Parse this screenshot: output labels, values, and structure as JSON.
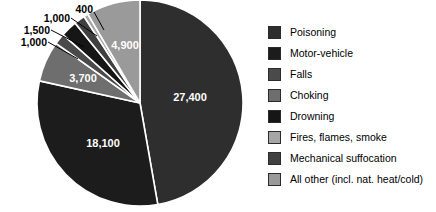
{
  "chart_data": {
    "type": "pie",
    "title": "",
    "subtitle": "",
    "xlabel": "",
    "ylabel": "",
    "legend_position": "right",
    "grid": false,
    "total": 58000,
    "categories": [
      "Poisoning",
      "Motor-vehicle",
      "Falls",
      "Choking",
      "Drowning",
      "Fires, flames, smoke",
      "Mechanical suffocation",
      "All other (incl. nat. heat/cold)"
    ],
    "values": [
      27400,
      18100,
      1000,
      3700,
      1500,
      400,
      1000,
      4900
    ],
    "value_labels": [
      "27,400",
      "18,100",
      "1,000",
      "3,700",
      "1,500",
      "400",
      "1,000",
      "4,900"
    ],
    "colors": [
      "#2e2e2e",
      "#1c1c1c",
      "#4a4a4a",
      "#6e6e6e",
      "#161616",
      "#a6a6a6",
      "#404040",
      "#9a9a9a"
    ],
    "slices": [
      {
        "name": "Poisoning",
        "value": 27400,
        "label": "27,400",
        "color": "#2e2e2e",
        "label_placement": "inside"
      },
      {
        "name": "Motor-vehicle",
        "value": 18100,
        "label": "18,100",
        "color": "#1c1c1c",
        "label_placement": "inside"
      },
      {
        "name": "Choking",
        "value": 3700,
        "label": "3,700",
        "color": "#6e6e6e",
        "label_placement": "inside"
      },
      {
        "name": "Falls",
        "value": 1000,
        "label": "1,000",
        "color": "#4a4a4a",
        "label_placement": "callout"
      },
      {
        "name": "Drowning",
        "value": 1500,
        "label": "1,500",
        "color": "#161616",
        "label_placement": "callout"
      },
      {
        "name": "Mechanical suffocation",
        "value": 1000,
        "label": "1,000",
        "color": "#404040",
        "label_placement": "callout"
      },
      {
        "name": "Fires, flames, smoke",
        "value": 400,
        "label": "400",
        "color": "#a6a6a6",
        "label_placement": "callout"
      },
      {
        "name": "All other (incl. nat. heat/cold)",
        "value": 4900,
        "label": "4,900",
        "color": "#9a9a9a",
        "label_placement": "inside"
      }
    ]
  },
  "pie": {
    "inside_labels": {
      "poisoning": "27,400",
      "motor_vehicle": "18,100",
      "choking": "3,700",
      "all_other": "4,900"
    },
    "callout_labels": {
      "falls": "1,000",
      "drowning": "1,500",
      "mechanical_suffocation": "1,000",
      "fires": "400"
    }
  },
  "legend": {
    "items": [
      {
        "label": "Poisoning",
        "color": "#2e2e2e"
      },
      {
        "label": "Motor-vehicle",
        "color": "#1c1c1c"
      },
      {
        "label": "Falls",
        "color": "#4a4a4a"
      },
      {
        "label": "Choking",
        "color": "#6e6e6e"
      },
      {
        "label": "Drowning",
        "color": "#161616"
      },
      {
        "label": "Fires, flames, smoke",
        "color": "#a6a6a6"
      },
      {
        "label": "Mechanical suffocation",
        "color": "#404040"
      },
      {
        "label": "All other (incl. nat. heat/cold)",
        "color": "#9a9a9a"
      }
    ]
  }
}
